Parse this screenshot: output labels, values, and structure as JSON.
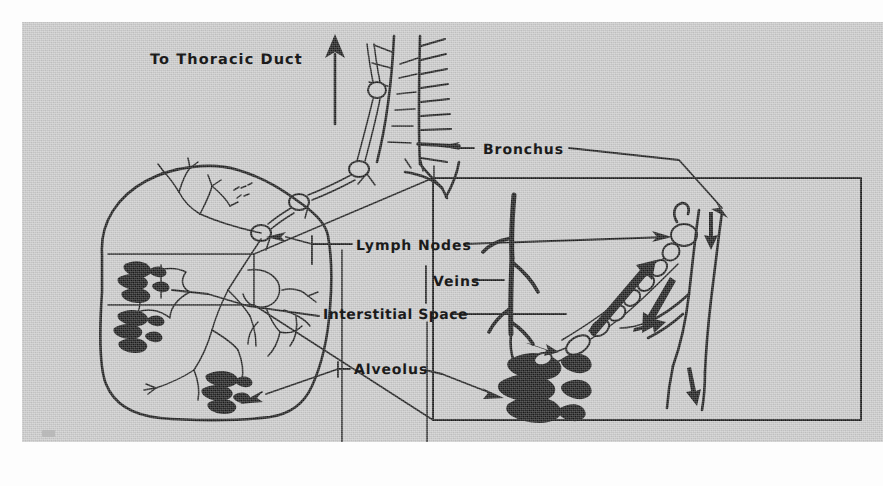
{
  "figure": {
    "background_color": "#cbcbcb",
    "ink_color": "#1b1b1b",
    "page_color": "#fdfdfd"
  },
  "labels": {
    "thoracic_duct": "To Thoracic Duct",
    "bronchus": "Bronchus",
    "lymph_nodes": "Lymph Nodes",
    "veins": "Veins",
    "interstitial_space": "Interstitial Space",
    "alveolus": "Alveolus"
  },
  "parts": {
    "lung": "lung-outline",
    "trachea": "trachea-with-cartilage-rings",
    "main_bronchus": "main-bronchus",
    "lymphatic_chain": "lymphatic-vessel-chain",
    "lymph_node": "lymph-node",
    "alveoli_cluster": "alveoli-cluster",
    "inset_panel": "magnified-inset-panel",
    "source_box": "magnification-source-box",
    "vein": "vein-branch",
    "flow_arrow": "flow-direction-arrow"
  }
}
